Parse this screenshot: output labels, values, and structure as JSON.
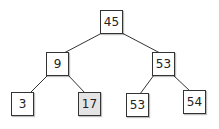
{
  "tree": {
    "nodes": [
      {
        "id": "root",
        "value": "45",
        "x": 100,
        "y": 10,
        "highlight": false
      },
      {
        "id": "l",
        "value": "9",
        "x": 46,
        "y": 52,
        "highlight": false
      },
      {
        "id": "r",
        "value": "53",
        "x": 152,
        "y": 52,
        "highlight": false
      },
      {
        "id": "ll",
        "value": "3",
        "x": 11,
        "y": 92,
        "highlight": false
      },
      {
        "id": "lr",
        "value": "17",
        "x": 78,
        "y": 92,
        "highlight": true
      },
      {
        "id": "rl",
        "value": "53",
        "x": 126,
        "y": 93,
        "highlight": false
      },
      {
        "id": "rr",
        "value": "54",
        "x": 183,
        "y": 90,
        "highlight": false
      }
    ],
    "edges": [
      [
        "root",
        "l"
      ],
      [
        "root",
        "r"
      ],
      [
        "l",
        "ll"
      ],
      [
        "l",
        "lr"
      ],
      [
        "r",
        "rl"
      ],
      [
        "r",
        "rr"
      ]
    ],
    "colors": {
      "highlight": "#e4e4e4",
      "border": "#333333"
    }
  }
}
